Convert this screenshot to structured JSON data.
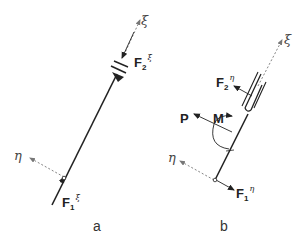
{
  "panels": [
    {
      "id": "a",
      "label": "a",
      "axis_xi": "ξ",
      "axis_eta": "η",
      "force_top": {
        "base": "F",
        "sub": "2",
        "sup": "ξ"
      },
      "force_bottom": {
        "base": "F",
        "sub": "1",
        "sup": "ξ"
      }
    },
    {
      "id": "b",
      "label": "b",
      "axis_xi": "ξ",
      "axis_eta": "η",
      "force_top": {
        "base": "F",
        "sub": "2",
        "sup": "η"
      },
      "force_bottom": {
        "base": "F",
        "sub": "1",
        "sup": "η"
      },
      "load_p": "P",
      "moment_m": "M"
    }
  ],
  "colors": {
    "line": "#222222",
    "axis": "#777777"
  }
}
